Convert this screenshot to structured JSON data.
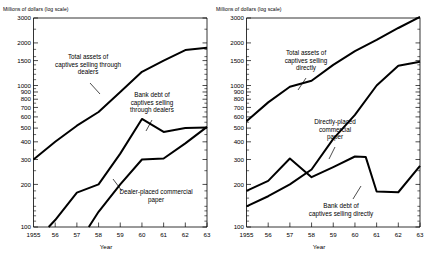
{
  "figure": {
    "background": "#ffffff",
    "ink_color": "#000000",
    "panel_count": 2
  },
  "chart_data": [
    {
      "type": "line",
      "panel": "left",
      "title": "",
      "ylabel": "Millions of dollars (log scale)",
      "xlabel": "Year",
      "yscale": "log",
      "ylim": [
        100,
        3000
      ],
      "xlim": [
        1955,
        1963
      ],
      "grid": false,
      "legend_position": "inline-annotations",
      "ytick_labels": [
        "3000",
        "2000",
        "1500",
        "1000",
        "900",
        "800",
        "700",
        "600",
        "500",
        "400",
        "300",
        "200",
        "100"
      ],
      "ytick_values": [
        3000,
        2000,
        1500,
        1000,
        900,
        800,
        700,
        600,
        500,
        400,
        300,
        200,
        100
      ],
      "yminor_values": [
        2500,
        1800,
        1600,
        1400,
        1300,
        1200,
        1100,
        950,
        850,
        750,
        650,
        550,
        450,
        350,
        250,
        180,
        160,
        140,
        130,
        120,
        110
      ],
      "xtick_labels": [
        "1955",
        "56",
        "57",
        "58",
        "59",
        "60",
        "61",
        "62",
        "63"
      ],
      "xtick_values": [
        1955,
        1956,
        1957,
        1958,
        1959,
        1960,
        1961,
        1962,
        1963
      ],
      "series": [
        {
          "name": "Total assets of captives selling through dealers",
          "label_lines": [
            "Total assets of",
            "captives selling through",
            "dealers"
          ],
          "x": [
            1955,
            1956,
            1957,
            1958,
            1959,
            1960,
            1961,
            1962,
            1963
          ],
          "values": [
            300,
            400,
            520,
            650,
            900,
            1250,
            1500,
            1780,
            1850
          ]
        },
        {
          "name": "Bank debt of captives selling through dealers",
          "label_lines": [
            "Bank debt of",
            "captives selling",
            "through dealers"
          ],
          "x": [
            1955.7,
            1956,
            1957,
            1958,
            1959,
            1960,
            1961,
            1962,
            1963
          ],
          "values": [
            100,
            112,
            175,
            200,
            330,
            580,
            470,
            500,
            505
          ]
        },
        {
          "name": "Dealer-placed commercial paper",
          "label_lines": [
            "Dealer-placed commercial",
            "paper"
          ],
          "x": [
            1957.55,
            1958,
            1959,
            1960,
            1961,
            1962,
            1963
          ],
          "values": [
            100,
            128,
            200,
            300,
            305,
            390,
            510
          ]
        }
      ]
    },
    {
      "type": "line",
      "panel": "right",
      "title": "",
      "ylabel": "Millions of dollars (log scale)",
      "xlabel": "Year",
      "yscale": "log",
      "ylim": [
        100,
        3000
      ],
      "xlim": [
        1955,
        1963
      ],
      "grid": false,
      "legend_position": "inline-annotations",
      "ytick_labels": [
        "3000",
        "2000",
        "1500",
        "1000",
        "900",
        "800",
        "700",
        "600",
        "500",
        "400",
        "300",
        "200",
        "100"
      ],
      "ytick_values": [
        3000,
        2000,
        1500,
        1000,
        900,
        800,
        700,
        600,
        500,
        400,
        300,
        200,
        100
      ],
      "yminor_values": [
        2500,
        1800,
        1600,
        1400,
        1300,
        1200,
        1100,
        950,
        850,
        750,
        650,
        550,
        450,
        350,
        250,
        180,
        160,
        140,
        130,
        120,
        110
      ],
      "xtick_labels": [
        "1955",
        "56",
        "57",
        "58",
        "59",
        "60",
        "61",
        "62",
        "63"
      ],
      "xtick_values": [
        1955,
        1956,
        1957,
        1958,
        1959,
        1960,
        1961,
        1962,
        1963
      ],
      "series": [
        {
          "name": "Total assets of captives selling directly",
          "label_lines": [
            "Total assets of",
            "captives selling",
            "directly"
          ],
          "x": [
            1955,
            1956,
            1957,
            1958,
            1959,
            1960,
            1961,
            1962,
            1963
          ],
          "values": [
            560,
            760,
            980,
            1080,
            1400,
            1750,
            2100,
            2550,
            3050
          ]
        },
        {
          "name": "Directly-placed commercial paper",
          "label_lines": [
            "Directly-placed",
            "commercial",
            "paper"
          ],
          "x": [
            1955,
            1956,
            1957,
            1958,
            1959,
            1960,
            1961,
            1962,
            1963
          ],
          "values": [
            140,
            165,
            200,
            255,
            420,
            620,
            1000,
            1380,
            1470
          ]
        },
        {
          "name": "Bank debt of captives selling directly",
          "label_lines": [
            "Bank debt of",
            "captives selling directly"
          ],
          "x": [
            1955,
            1956,
            1957,
            1958,
            1959,
            1960,
            1960.5,
            1961,
            1962,
            1963
          ],
          "values": [
            180,
            212,
            305,
            225,
            265,
            315,
            312,
            178,
            176,
            270
          ]
        }
      ]
    }
  ]
}
